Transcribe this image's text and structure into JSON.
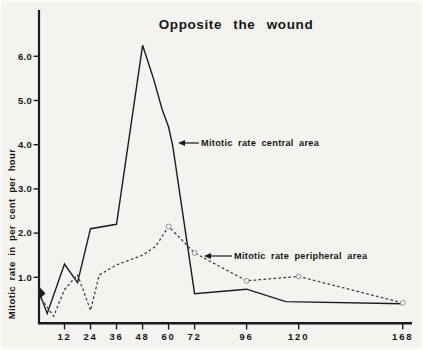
{
  "figure": {
    "kind": "scanned line chart"
  },
  "chart_data": {
    "type": "line",
    "title": "Opposite the wound",
    "xlabel": "",
    "ylabel": "Mitotic rate in per cent per hour",
    "x_unit_hours": true,
    "xlim": [
      0,
      172
    ],
    "ylim": [
      0,
      7
    ],
    "grid": false,
    "x_ticks": [
      12,
      24,
      36,
      48,
      60,
      72,
      96,
      120,
      168
    ],
    "y_ticks": [
      "1.0",
      "2.0",
      "3.0",
      "4.0",
      "5.0",
      "6.0"
    ],
    "series": [
      {
        "name": "Mitotic rate central area",
        "style": "solid",
        "points": [
          [
            0,
            0.7
          ],
          [
            4,
            0.18
          ],
          [
            12,
            1.3
          ],
          [
            18,
            0.88
          ],
          [
            24,
            2.1
          ],
          [
            36,
            2.2
          ],
          [
            48,
            6.25
          ],
          [
            53,
            5.5
          ],
          [
            57,
            4.8
          ],
          [
            60,
            4.4
          ],
          [
            62,
            3.95
          ],
          [
            72,
            0.63
          ],
          [
            96,
            0.73
          ],
          [
            114,
            0.45
          ],
          [
            168,
            0.4
          ]
        ]
      },
      {
        "name": "Mitotic rate peripheral area",
        "style": "dotted",
        "points": [
          [
            0,
            0.6
          ],
          [
            7,
            0.12
          ],
          [
            12,
            0.72
          ],
          [
            18,
            1.06
          ],
          [
            24,
            0.25
          ],
          [
            28,
            1.05
          ],
          [
            36,
            1.28
          ],
          [
            48,
            1.5
          ],
          [
            54,
            1.7
          ],
          [
            60,
            2.15
          ],
          [
            66,
            1.85
          ],
          [
            72,
            1.55
          ],
          [
            96,
            0.92
          ],
          [
            120,
            1.02
          ],
          [
            168,
            0.42
          ]
        ],
        "markers": [
          [
            60,
            2.15
          ],
          [
            72,
            1.55
          ],
          [
            96,
            0.92
          ],
          [
            120,
            1.02
          ],
          [
            168,
            0.42
          ]
        ]
      }
    ],
    "annotations": [
      {
        "text": "Mitotic rate central area",
        "target_series": "central",
        "text_x": 201,
        "text_y": 143,
        "arrow_from": [
          199,
          143
        ],
        "arrow_tip": [
          178,
          143
        ]
      },
      {
        "text": "Mitotic rate peripheral area",
        "target_series": "peripheral",
        "text_x": 234,
        "text_y": 256,
        "arrow_from": [
          232,
          256
        ],
        "arrow_tip": [
          204,
          256
        ]
      }
    ],
    "colors": {
      "axis": "#1b1b1b",
      "solid_line": "#1c1c1c",
      "dotted_line": "#3e3e3e",
      "marker_ring": "#8b8b8b",
      "background": "#f4f3ef",
      "text": "#161616"
    }
  }
}
